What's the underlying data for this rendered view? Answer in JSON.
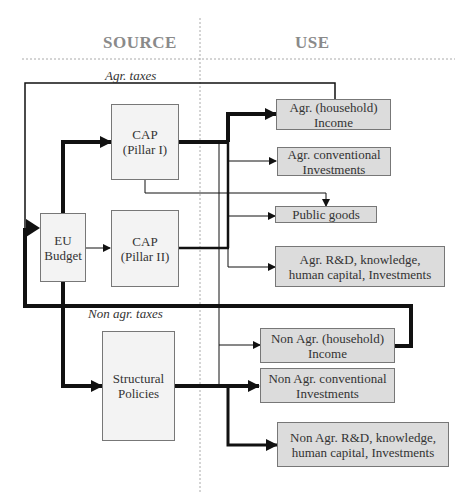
{
  "headers": {
    "source": "SOURCE",
    "use": "USE"
  },
  "labels": {
    "agr_taxes": "Agr. taxes",
    "non_agr_taxes": "Non agr. taxes"
  },
  "source_boxes": {
    "eu_budget": "EU Budget",
    "cap_pillar1": "CAP (Pillar I)",
    "cap_pillar2": "CAP (Pillar II)",
    "structural": "Structural Policies"
  },
  "source_lines": {
    "eu_budget": [
      "EU",
      "Budget"
    ],
    "cap_pillar1": [
      "CAP",
      "(Pillar I)"
    ],
    "cap_pillar2": [
      "CAP",
      "(Pillar II)"
    ],
    "structural": [
      "Structural",
      "Policies"
    ]
  },
  "use_boxes": [
    {
      "id": "agr-income",
      "lines": [
        "Agr. (household)",
        "Income"
      ]
    },
    {
      "id": "agr-conventional",
      "lines": [
        "Agr. conventional",
        "Investments"
      ]
    },
    {
      "id": "public-goods",
      "lines": [
        "Public goods"
      ]
    },
    {
      "id": "agr-rd",
      "lines": [
        "Agr. R&D, knowledge,",
        "human capital, Investments"
      ]
    },
    {
      "id": "nonagr-income",
      "lines": [
        "Non Agr. (household)",
        "Income"
      ]
    },
    {
      "id": "nonagr-conventional",
      "lines": [
        "Non Agr. conventional",
        "Investments"
      ]
    },
    {
      "id": "nonagr-rd",
      "lines": [
        "Non Agr. R&D, knowledge,",
        "human capital, Investments"
      ]
    }
  ],
  "colors": {
    "header": "#8a8a8a",
    "use_box_fill": "#dcdcdc",
    "source_box_fill": "#f3f3f3",
    "line": "#111111"
  }
}
